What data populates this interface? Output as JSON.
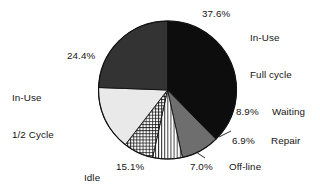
{
  "chart_data": {
    "type": "pie",
    "title": "",
    "subtitle": "",
    "xlabel": "",
    "ylabel": "",
    "legend_position": "none",
    "grid": false,
    "start_angle_deg": 0,
    "direction": "clockwise",
    "units": "percent",
    "total": 100.0,
    "categories": [
      "In-Use Full cycle",
      "Waiting",
      "Repair",
      "Off-line",
      "Idle",
      "In-Use 1/2 Cycle"
    ],
    "values": [
      37.6,
      8.9,
      6.9,
      7.0,
      15.1,
      24.4
    ],
    "slices": [
      {
        "label": "In-Use Full cycle",
        "label_line1": "In-Use",
        "label_line2": "Full cycle",
        "value": 37.6,
        "pct_text": "37.6%",
        "fill": "#0d0d0d",
        "pattern": "solid",
        "label_side": "top-right"
      },
      {
        "label": "Waiting",
        "label_line1": "Waiting",
        "label_line2": "",
        "value": 8.9,
        "pct_text": "8.9%",
        "fill": "#6e6e6e",
        "pattern": "solid",
        "label_side": "right"
      },
      {
        "label": "Repair",
        "label_line1": "Repair",
        "label_line2": "",
        "value": 6.9,
        "pct_text": "6.9%",
        "fill": "#ffffff",
        "pattern": "vertical-lines",
        "label_side": "right"
      },
      {
        "label": "Off-line",
        "label_line1": "Off-line",
        "label_line2": "",
        "value": 7.0,
        "pct_text": "7.0%",
        "fill": "#ffffff",
        "pattern": "cross-hatch",
        "label_side": "bottom-right"
      },
      {
        "label": "Idle",
        "label_line1": "Idle",
        "label_line2": "",
        "value": 15.1,
        "pct_text": "15.1%",
        "fill": "#e9e9e9",
        "pattern": "solid",
        "label_side": "bottom"
      },
      {
        "label": "In-Use 1/2 Cycle",
        "label_line1": "In-Use",
        "label_line2": "1/2 Cycle",
        "value": 24.4,
        "pct_text": "24.4%",
        "fill": "#333333",
        "pattern": "solid",
        "label_side": "left"
      }
    ]
  },
  "labels": {
    "full_cycle_pct": "37.6%",
    "full_cycle_l1": "In-Use",
    "full_cycle_l2": "Full cycle",
    "half_cycle_pct": "24.4%",
    "half_cycle_l1": "In-Use",
    "half_cycle_l2": "1/2 Cycle",
    "waiting_pct": "8.9%",
    "waiting_cat": "Waiting",
    "repair_pct": "6.9%",
    "repair_cat": "Repair",
    "offline_pct": "7.0%",
    "offline_cat": "Off-line",
    "idle_pct": "15.1%",
    "idle_cat": "Idle"
  },
  "colors": {
    "background": "#ffffff",
    "outline": "#111111",
    "text": "#141414",
    "slice_black": "#0d0d0d",
    "slice_dark_gray": "#333333",
    "slice_mid_gray": "#6e6e6e",
    "slice_light_gray": "#e9e9e9",
    "hatch_white": "#ffffff"
  }
}
